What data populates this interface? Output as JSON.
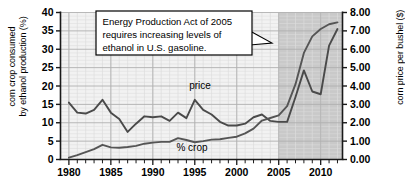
{
  "chart_data": {
    "type": "line",
    "title": "",
    "xlabel": "",
    "ylabel": "corn crop consumed by ethanol production (%)",
    "ylabel_right": "corn price per bushel ($)",
    "xlim": [
      1979,
      2012.6
    ],
    "ylim": [
      0,
      40
    ],
    "ylim_right": [
      0.0,
      8.0
    ],
    "grid": true,
    "legend": "inline-labels",
    "x_tick_labels": [
      "1980",
      "1985",
      "1990",
      "1995",
      "2000",
      "2005",
      "2010"
    ],
    "x_tick_values": [
      1980,
      1985,
      1990,
      1995,
      2000,
      2005,
      2010
    ],
    "x_minor_ticks_every": 1,
    "y_tick_labels": [
      "0",
      "5",
      "10",
      "15",
      "20",
      "25",
      "30",
      "35",
      "40"
    ],
    "y_tick_values": [
      0,
      5,
      10,
      15,
      20,
      25,
      30,
      35,
      40
    ],
    "y_right_tick_labels": [
      "0.00",
      "1.00",
      "2.00",
      "3.00",
      "4.00",
      "5.00",
      "6.00",
      "7.00",
      "8.00"
    ],
    "y_right_tick_values": [
      0.0,
      1.0,
      2.0,
      3.0,
      4.0,
      5.0,
      6.0,
      7.0,
      8.0
    ],
    "shaded_region": {
      "label": "post-2005 policy period",
      "x_start": 2005,
      "x_end": 2012.6,
      "color": "#c9c9c9"
    },
    "series": [
      {
        "name": "price",
        "label": "price",
        "axis": "right",
        "units": "$ per bushel",
        "color": "#4a4a4a",
        "x": [
          1980,
          1981,
          1982,
          1983,
          1984,
          1985,
          1986,
          1987,
          1988,
          1989,
          1990,
          1991,
          1992,
          1993,
          1994,
          1995,
          1996,
          1997,
          1998,
          1999,
          2000,
          2001,
          2002,
          2003,
          2004,
          2005,
          2006,
          2007,
          2008,
          2009,
          2010,
          2011,
          2012
        ],
        "values": [
          3.1,
          2.55,
          2.5,
          2.7,
          3.25,
          2.55,
          2.2,
          1.5,
          1.95,
          2.35,
          2.3,
          2.35,
          2.1,
          2.55,
          2.25,
          3.25,
          2.7,
          2.45,
          2.05,
          1.85,
          1.85,
          1.95,
          2.3,
          2.45,
          2.1,
          2.05,
          2.05,
          3.4,
          4.85,
          3.7,
          3.55,
          6.2,
          7.1
        ]
      },
      {
        "name": "percent_crop",
        "label": "% crop",
        "axis": "left",
        "units": "%",
        "color": "#555555",
        "x": [
          1980,
          1981,
          1982,
          1983,
          1984,
          1985,
          1986,
          1987,
          1988,
          1989,
          1990,
          1991,
          1992,
          1993,
          1994,
          1995,
          1996,
          1997,
          1998,
          1999,
          2000,
          2001,
          2002,
          2003,
          2004,
          2005,
          2006,
          2007,
          2008,
          2009,
          2010,
          2011,
          2012
        ],
        "values": [
          0.5,
          1.2,
          2.0,
          2.8,
          4.0,
          3.3,
          3.2,
          3.4,
          3.7,
          4.3,
          4.6,
          4.8,
          4.8,
          5.8,
          5.3,
          4.7,
          5.0,
          5.4,
          5.5,
          5.9,
          6.2,
          7.1,
          8.4,
          10.6,
          11.3,
          12.0,
          14.5,
          20.5,
          29.0,
          33.5,
          35.5,
          36.8,
          37.3
        ]
      }
    ],
    "annotations": [
      {
        "name": "energy-act-callout",
        "lines": [
          "Energy Production Act of 2005",
          "requires increasing levels of",
          "ethanol in U.S. gasoline."
        ],
        "points_to_x": 2005.4,
        "points_to_y_pct": 24
      }
    ]
  },
  "axes": {
    "left_label": "corn crop consumed by ethanol production (%)",
    "left_label_line1": "corn crop consumed",
    "left_label_line2": "by ethanol production (%)",
    "right_label": "corn price per bushel ($)"
  },
  "labels": {
    "price": "price",
    "percent_crop": "% crop"
  },
  "callout": {
    "line1": "Energy Production Act of 2005",
    "line2": "requires increasing levels of",
    "line3": "ethanol in U.S. gasoline."
  },
  "colors": {
    "background": "#ffffff",
    "plot_background": "#f2f2f2",
    "shaded": "#c9c9c9",
    "grid_minor": "#dcdcdc",
    "grid_major": "#b0b0b0",
    "line_price": "#4a4a4a",
    "line_percent": "#555555",
    "axis": "#1a1a1a"
  }
}
